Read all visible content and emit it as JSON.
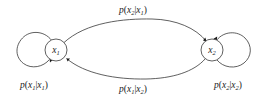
{
  "figure": {
    "type": "state-transition-diagram",
    "background_color": "#ffffff",
    "stroke_color": "#2b2b2b",
    "text_color": "#1a1a1a",
    "width": 266,
    "height": 97
  },
  "nodes": [
    {
      "id": "x1",
      "label_base": "x",
      "label_sub": "1",
      "cx": 56,
      "cy": 50,
      "r": 11
    },
    {
      "id": "x2",
      "label_base": "x",
      "label_sub": "2",
      "cx": 212,
      "cy": 50,
      "r": 11
    }
  ],
  "edges": [
    {
      "id": "x1-to-x2",
      "kind": "arc-top",
      "from": "x1",
      "to": "x2",
      "label": {
        "p": "p",
        "open": "(",
        "head_base": "x",
        "head_sub": "2",
        "bar": "|",
        "tail_base": "x",
        "tail_sub": "1",
        "close": ")",
        "text": "p(x2|x1)"
      },
      "label_x": 133,
      "label_y": 12
    },
    {
      "id": "x2-to-x1",
      "kind": "arc-bottom",
      "from": "x2",
      "to": "x1",
      "label": {
        "p": "p",
        "open": "(",
        "head_base": "x",
        "head_sub": "1",
        "bar": "|",
        "tail_base": "x",
        "tail_sub": "2",
        "close": ")",
        "text": "p(x1|x2)"
      },
      "label_x": 133,
      "label_y": 90
    },
    {
      "id": "x1-self",
      "kind": "self-loop-left",
      "from": "x1",
      "to": "x1",
      "label": {
        "p": "p",
        "open": "(",
        "head_base": "x",
        "head_sub": "1",
        "bar": "|",
        "tail_base": "x",
        "tail_sub": "1",
        "close": ")",
        "text": "p(x1|x1)"
      },
      "label_x": 34,
      "label_y": 85
    },
    {
      "id": "x2-self",
      "kind": "self-loop-right",
      "from": "x2",
      "to": "x2",
      "label": {
        "p": "p",
        "open": "(",
        "head_base": "x",
        "head_sub": "2",
        "bar": "|",
        "tail_base": "x",
        "tail_sub": "2",
        "close": ")",
        "text": "p(x2|x2)"
      },
      "label_x": 228,
      "label_y": 85
    }
  ]
}
